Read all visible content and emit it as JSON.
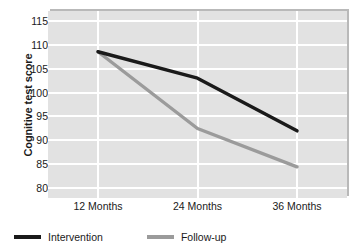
{
  "chart_data": {
    "type": "line",
    "title": "",
    "xlabel": "",
    "ylabel": "Cognitive test score",
    "categories": [
      "12 Months",
      "24 Months",
      "36 Months"
    ],
    "ylim": [
      78,
      117
    ],
    "yticks": [
      80,
      85,
      90,
      95,
      100,
      105,
      110,
      115
    ],
    "ytick_labels": [
      "80",
      "85",
      "90",
      "95",
      "100",
      "105",
      "110",
      "115"
    ],
    "grid": true,
    "legend_position": "bottom-left",
    "series": [
      {
        "name": "Intervention",
        "color": "#1a1a1a",
        "values": [
          108.5,
          103.0,
          92.0
        ]
      },
      {
        "name": "Follow-up",
        "color": "#9b9b9b",
        "values": [
          108.5,
          92.5,
          84.5
        ]
      }
    ]
  },
  "axes": {
    "y_title": "Cognitive test score",
    "y_tick_labels": [
      "115",
      "110",
      "105",
      "100",
      "95",
      "90",
      "85",
      "80"
    ],
    "x_tick_labels": [
      "12 Months",
      "24 Months",
      "36 Months"
    ]
  },
  "legend": {
    "items": [
      {
        "label": "Intervention",
        "color": "#1a1a1a"
      },
      {
        "label": "Follow-up",
        "color": "#9b9b9b"
      }
    ]
  },
  "style": {
    "plot_background": "#e2e2e2",
    "gridline_color": "#ffffff",
    "shadow_color": "#b9b9b9",
    "text_color": "#1a1a1a"
  }
}
